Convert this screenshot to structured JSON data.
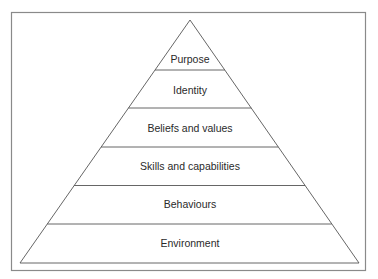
{
  "diagram": {
    "type": "pyramid",
    "levels_top_to_bottom": [
      {
        "label": "Purpose"
      },
      {
        "label": "Identity"
      },
      {
        "label": "Beliefs and values"
      },
      {
        "label": "Skills and capabilities"
      },
      {
        "label": "Behaviours"
      },
      {
        "label": "Environment"
      }
    ]
  }
}
